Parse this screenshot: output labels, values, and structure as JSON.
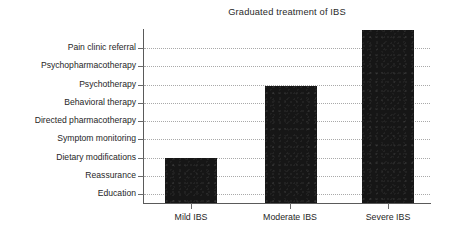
{
  "chart_data": {
    "type": "bar",
    "title": "Graduated treatment of IBS",
    "xlabel": "",
    "ylabel": "",
    "categories": [
      "Mild IBS",
      "Moderate IBS",
      "Severe IBS"
    ],
    "values": [
      3,
      7,
      9
    ],
    "ytick_labels": [
      "Education",
      "Reassurance",
      "Dietary modifications",
      "Symptom monitoring",
      "Directed pharmacotherapy",
      "Behavioral therapy",
      "Psychotherapy",
      "Psychopharmacotherapy",
      "Pain clinic referral"
    ],
    "ylim": [
      0,
      9.5
    ],
    "grid": true,
    "grid_axis": "y",
    "grid_style": "dotted",
    "legend": "none",
    "bar_color": "#161616",
    "series": [
      {
        "name": "Treatment escalation",
        "values": [
          3,
          7,
          9
        ],
        "value_labels": [
          "Dietary modifications",
          "Psychotherapy",
          "Pain clinic referral"
        ]
      }
    ]
  },
  "ticks": {
    "y": [
      {
        "label": "Pain clinic referral",
        "level": 9,
        "y": 48
      },
      {
        "label": "Psychopharmacotherapy",
        "level": 8,
        "y": 66
      },
      {
        "label": "Psychotherapy",
        "level": 7,
        "y": 85
      },
      {
        "label": "Behavioral therapy",
        "level": 6,
        "y": 103
      },
      {
        "label": "Directed pharmacotherapy",
        "level": 5,
        "y": 121
      },
      {
        "label": "Symptom monitoring",
        "level": 4,
        "y": 139
      },
      {
        "label": "Dietary modifications",
        "level": 3,
        "y": 158
      },
      {
        "label": "Reassurance",
        "level": 2,
        "y": 176
      },
      {
        "label": "Education",
        "level": 1,
        "y": 194
      }
    ],
    "x": [
      {
        "label": "Mild IBS",
        "center": 191,
        "bar_left": 165,
        "bar_width": 52,
        "bar_top": 158
      },
      {
        "label": "Moderate IBS",
        "center": 290,
        "bar_left": 265,
        "bar_width": 52,
        "bar_top": 86
      },
      {
        "label": "Severe IBS",
        "center": 388,
        "bar_left": 362,
        "bar_width": 52,
        "bar_top": 30
      }
    ]
  }
}
